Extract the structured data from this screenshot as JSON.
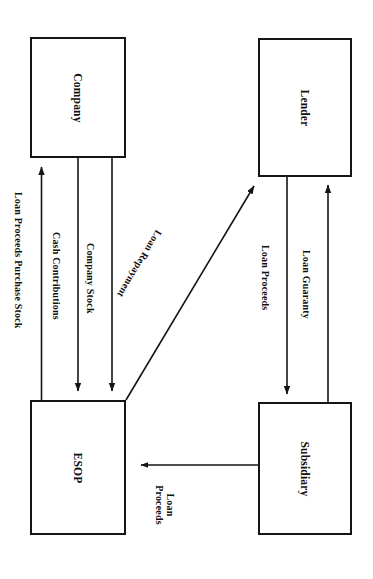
{
  "diagram": {
    "type": "flowchart",
    "orientation": "rotated-90-clockwise",
    "background_color": "#ffffff",
    "line_color": "#151515",
    "nodes": [
      {
        "id": "company",
        "label": "Company",
        "x": 30,
        "y": 37,
        "w": 96,
        "h": 121
      },
      {
        "id": "lender",
        "label": "Lender",
        "x": 258,
        "y": 38,
        "w": 94,
        "h": 139
      },
      {
        "id": "esop",
        "label": "ESOP",
        "x": 30,
        "y": 400,
        "w": 96,
        "h": 135
      },
      {
        "id": "subsidiary",
        "label": "Subsidiary",
        "x": 258,
        "y": 402,
        "w": 94,
        "h": 133
      }
    ],
    "edges": [
      {
        "id": "loan-proceeds-purchase-stock",
        "label": "Loan Proceeds Purchase Stock",
        "from": "esop",
        "to": "company",
        "direction": "up"
      },
      {
        "id": "cash-contributions",
        "label": "Cash Contributions",
        "from": "company",
        "to": "esop",
        "direction": "down"
      },
      {
        "id": "company-stock",
        "label": "Company Stock",
        "from": "company",
        "to": "esop",
        "direction": "down"
      },
      {
        "id": "loan-repayment",
        "label": "Loan Repayment",
        "from": "esop",
        "to": "lender",
        "direction": "diagonal-up-right"
      },
      {
        "id": "loan-proceeds-lender",
        "label": "Loan Proceeds",
        "from": "lender",
        "to": "subsidiary",
        "direction": "down"
      },
      {
        "id": "loan-guaranty",
        "label": "Loan Guaranty",
        "from": "subsidiary",
        "to": "lender",
        "direction": "up"
      },
      {
        "id": "loan-proceeds-subsidiary",
        "label": "Loan\nProceeds",
        "label_line1": "Loan",
        "label_line2": "Proceeds",
        "from": "subsidiary",
        "to": "esop",
        "direction": "left"
      }
    ]
  }
}
